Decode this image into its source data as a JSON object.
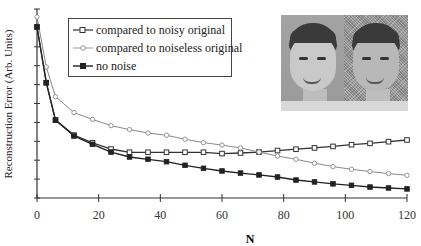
{
  "chart_data": {
    "type": "line",
    "title": "",
    "xlabel": "N",
    "ylabel": "Reconstruction Error (Arb. Units)",
    "xlim": [
      0,
      120
    ],
    "ylim": [
      0,
      10
    ],
    "x_ticks": [
      0,
      20,
      40,
      60,
      80,
      100,
      120
    ],
    "x_tick_labels": [
      "0",
      "20",
      "40",
      "60",
      "80",
      "100",
      "120"
    ],
    "y_tick_count": 10,
    "y_tick_labels_shown": false,
    "grid": false,
    "legend_position": "upper left (inset)",
    "x": [
      0,
      3,
      6,
      12,
      18,
      24,
      30,
      36,
      42,
      48,
      54,
      60,
      66,
      72,
      78,
      84,
      90,
      96,
      102,
      108,
      114,
      120
    ],
    "series": [
      {
        "name": "compared to noisy original",
        "marker": "open-square",
        "color": "#333333",
        "values": [
          9.05,
          6.1,
          4.12,
          3.33,
          2.92,
          2.59,
          2.42,
          2.42,
          2.42,
          2.42,
          2.42,
          2.35,
          2.38,
          2.43,
          2.51,
          2.58,
          2.65,
          2.73,
          2.82,
          2.89,
          2.98,
          3.07
        ]
      },
      {
        "name": "compared to noiseless original",
        "marker": "open-circle",
        "color": "#8a8a8a",
        "values": [
          9.58,
          6.93,
          5.36,
          4.52,
          4.16,
          3.83,
          3.62,
          3.44,
          3.32,
          3.11,
          2.93,
          2.8,
          2.65,
          2.43,
          2.22,
          2.05,
          1.84,
          1.66,
          1.52,
          1.4,
          1.29,
          1.2
        ]
      },
      {
        "name": "no noise",
        "marker": "filled-square",
        "color": "#222222",
        "values": [
          9.05,
          6.1,
          4.12,
          3.28,
          2.84,
          2.43,
          2.17,
          2.05,
          1.92,
          1.73,
          1.57,
          1.43,
          1.32,
          1.22,
          1.11,
          0.95,
          0.85,
          0.75,
          0.67,
          0.58,
          0.53,
          0.48
        ]
      }
    ],
    "inset_image": {
      "description": "Two side-by-side grayscale portraits of a boy: left noiseless original, right noisy original"
    }
  },
  "legend": {
    "items": [
      {
        "label": "compared to noisy original"
      },
      {
        "label": "compared to noiseless original"
      },
      {
        "label": "no noise"
      }
    ]
  },
  "axes": {
    "xlabel": "N",
    "ylabel": "Reconstruction Error (Arb. Units)"
  }
}
